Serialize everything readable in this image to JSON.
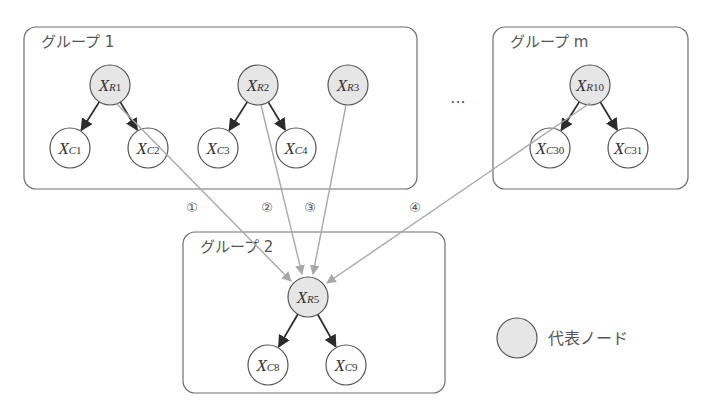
{
  "groups": [
    {
      "id": "group-1",
      "label": "グループ 1",
      "x": 24,
      "y": 27,
      "w": 393,
      "h": 162
    },
    {
      "id": "group-m",
      "label": "グループ m",
      "x": 493,
      "y": 27,
      "w": 195,
      "h": 162
    },
    {
      "id": "group-2",
      "label": "グループ 2",
      "x": 183,
      "y": 232,
      "w": 262,
      "h": 161
    }
  ],
  "nodes": [
    {
      "id": "XR1",
      "main": "X",
      "sub_it": "R",
      "sub": "1",
      "type": "rep",
      "cx": 110,
      "cy": 85
    },
    {
      "id": "XC1",
      "main": "X",
      "sub_it": "C",
      "sub": "1",
      "type": "child",
      "cx": 70,
      "cy": 148
    },
    {
      "id": "XC2",
      "main": "X",
      "sub_it": "C",
      "sub": "2",
      "type": "child",
      "cx": 148,
      "cy": 148
    },
    {
      "id": "XR2",
      "main": "X",
      "sub_it": "R",
      "sub": "2",
      "type": "rep",
      "cx": 258,
      "cy": 85
    },
    {
      "id": "XC3",
      "main": "X",
      "sub_it": "C",
      "sub": "3",
      "type": "child",
      "cx": 218,
      "cy": 148
    },
    {
      "id": "XC4",
      "main": "X",
      "sub_it": "C",
      "sub": "4",
      "type": "child",
      "cx": 296,
      "cy": 148
    },
    {
      "id": "XR3",
      "main": "X",
      "sub_it": "R",
      "sub": "3",
      "type": "rep",
      "cx": 348,
      "cy": 85
    },
    {
      "id": "XR10",
      "main": "X",
      "sub_it": "R",
      "sub": "10",
      "type": "rep",
      "cx": 590,
      "cy": 85
    },
    {
      "id": "XC30",
      "main": "X",
      "sub_it": "C",
      "sub": "30",
      "type": "child",
      "cx": 550,
      "cy": 148
    },
    {
      "id": "XC31",
      "main": "X",
      "sub_it": "C",
      "sub": "31",
      "type": "child",
      "cx": 628,
      "cy": 148
    },
    {
      "id": "XR5",
      "main": "X",
      "sub_it": "R",
      "sub": "5",
      "type": "rep",
      "cx": 308,
      "cy": 297
    },
    {
      "id": "XC8",
      "main": "X",
      "sub_it": "C",
      "sub": "8",
      "type": "child",
      "cx": 268,
      "cy": 365
    },
    {
      "id": "XC9",
      "main": "X",
      "sub_it": "C",
      "sub": "9",
      "type": "child",
      "cx": 346,
      "cy": 365
    }
  ],
  "tree_edges": [
    {
      "from": "XR1",
      "to": "XC1"
    },
    {
      "from": "XR1",
      "to": "XC2"
    },
    {
      "from": "XR2",
      "to": "XC3"
    },
    {
      "from": "XR2",
      "to": "XC4"
    },
    {
      "from": "XR10",
      "to": "XC30"
    },
    {
      "from": "XR10",
      "to": "XC31"
    },
    {
      "from": "XR5",
      "to": "XC8"
    },
    {
      "from": "XR5",
      "to": "XC9"
    }
  ],
  "links": [
    {
      "label": "1",
      "symbol": "①",
      "from": "XR1",
      "to": "XR5",
      "x1": 116,
      "y1": 103,
      "x2": 291,
      "y2": 281,
      "lx": 192,
      "ly": 207
    },
    {
      "label": "2",
      "symbol": "②",
      "from": "XR2",
      "to": "XR5",
      "x1": 261,
      "y1": 105,
      "x2": 302,
      "y2": 274,
      "lx": 267,
      "ly": 207
    },
    {
      "label": "3",
      "symbol": "③",
      "from": "XR3",
      "to": "XR5",
      "x1": 346,
      "y1": 105,
      "x2": 313,
      "y2": 274,
      "lx": 310,
      "ly": 207
    },
    {
      "label": "4",
      "symbol": "④",
      "from": "XR10",
      "to": "XR5",
      "x1": 590,
      "y1": 103,
      "x2": 327,
      "y2": 283,
      "lx": 415,
      "ly": 207
    }
  ],
  "ellipsis": {
    "text": "···",
    "x": 458,
    "y": 108
  },
  "legend": {
    "label": "代表ノード",
    "cx": 517,
    "cy": 338,
    "r": 20
  },
  "colors": {
    "rep_fill": "#e6e6e6",
    "child_fill": "#ffffff",
    "tree_edge": "#2c2c2c",
    "link_edge": "#a8a8a8"
  }
}
